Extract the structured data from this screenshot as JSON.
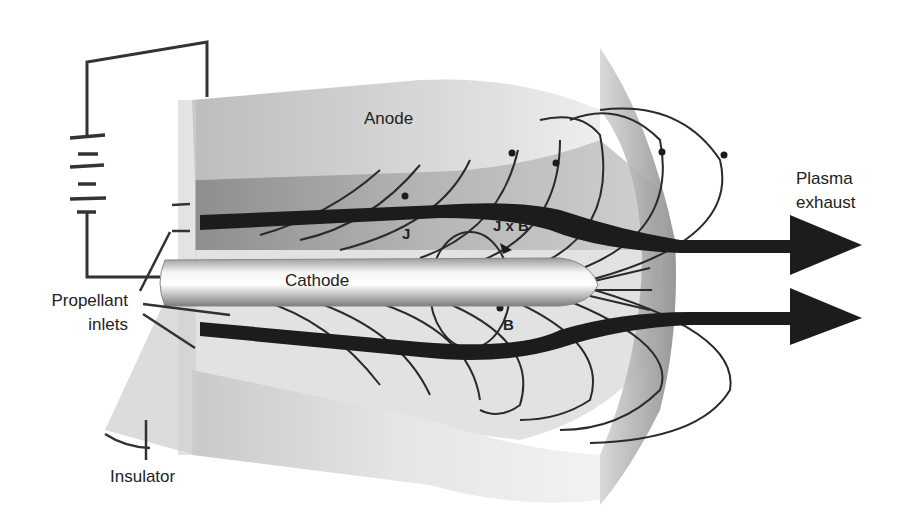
{
  "labels": {
    "anode": "Anode",
    "cathode": "Cathode",
    "plasma_exhaust_line1": "Plasma",
    "plasma_exhaust_line2": "exhaust",
    "propellant_inlets_line1": "Propellant",
    "propellant_inlets_line2": "inlets",
    "insulator": "Insulator",
    "current": "J",
    "force": "J x B",
    "magnetic_field": "B"
  },
  "colors": {
    "background": "#ffffff",
    "anode_face": "#c8c8c8",
    "anode_inner": "#9a9a9a",
    "body_light": "#e6e6e6",
    "rim": "#8f8f8f",
    "cathode_light": "#f4f4f4",
    "cathode_dark": "#8a8a8a",
    "flow_arrow": "#1c1c1c",
    "field_line": "#2a2a2a",
    "wire": "#333333"
  },
  "icons": {
    "battery": "battery-icon",
    "flow_arrow": "arrow-right-icon"
  }
}
